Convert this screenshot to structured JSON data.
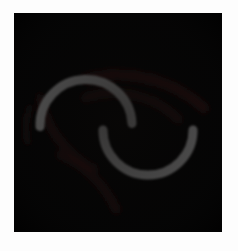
{
  "figure": {
    "title": "",
    "background_color": "#fdfdfd",
    "panel_background_color": "#050505",
    "panel_left": 14,
    "panel_top": 13,
    "panel_width": 208,
    "panel_height": 219
  },
  "chart_data": {
    "type": "scatter",
    "title": "",
    "subtitle": "",
    "xlabel": "",
    "ylabel": "",
    "xlim": [
      0,
      208
    ],
    "ylim": [
      0,
      219
    ],
    "grid": false,
    "legend": null,
    "background": "#050505",
    "series": [
      {
        "name": "upper-arc",
        "shape": "arc",
        "color": "#6b6b6b",
        "stroke_width": 9,
        "center_x": 72,
        "center_y": 112,
        "radius": 46,
        "start_angle_deg": 178,
        "end_angle_deg": 358,
        "opening": "down",
        "peak_point": [
          72,
          71
        ],
        "endpoints": [
          [
            26,
            110
          ],
          [
            118,
            112
          ]
        ]
      },
      {
        "name": "lower-arc",
        "shape": "arc",
        "color": "#6b6b6b",
        "stroke_width": 9,
        "center_x": 134,
        "center_y": 117,
        "radius": 45,
        "start_angle_deg": 0,
        "end_angle_deg": 180,
        "opening": "up",
        "peak_point": [
          134,
          162
        ],
        "endpoints": [
          [
            89,
            117
          ],
          [
            179,
            113
          ]
        ]
      },
      {
        "name": "faint-streak-upper-right-outer",
        "shape": "arc",
        "color": "#2a1312",
        "stroke_width": 11,
        "center_x": 104,
        "center_y": 190,
        "radius": 128,
        "start_angle_deg": 256,
        "end_angle_deg": 312,
        "opacity": 0.72
      },
      {
        "name": "faint-streak-upper-right-inner",
        "shape": "arc",
        "color": "#281211",
        "stroke_width": 10,
        "center_x": 100,
        "center_y": 172,
        "radius": 92,
        "start_angle_deg": 252,
        "end_angle_deg": 314,
        "opacity": 0.66
      },
      {
        "name": "faint-streak-lower-left",
        "shape": "arc",
        "color": "#24100f",
        "stroke_width": 10,
        "center_x": 128,
        "center_y": 64,
        "radius": 104,
        "start_angle_deg": 118,
        "end_angle_deg": 168,
        "opacity": 0.7
      },
      {
        "name": "faint-streak-left-edge",
        "shape": "arc",
        "color": "#20100f",
        "stroke_width": 7,
        "center_x": 74,
        "center_y": 116,
        "radius": 62,
        "start_angle_deg": 168,
        "end_angle_deg": 200,
        "opacity": 0.6
      }
    ],
    "annotations": [],
    "tick_labels": {
      "x": [],
      "y": []
    }
  },
  "accessibility": {
    "alt_text": "Dark square image panel with two gray arcs forming an S shape and faint reddish spiral streaks"
  }
}
